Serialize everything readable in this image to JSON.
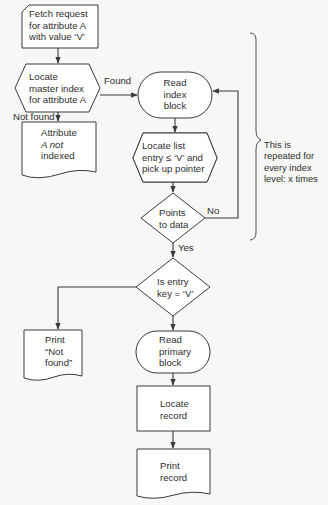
{
  "diagram": {
    "type": "flowchart",
    "nodes": {
      "fetch_request": {
        "shape": "card",
        "lines": [
          "Fetch request",
          "for attribute A",
          "with value ‘V’"
        ]
      },
      "locate_master_index": {
        "shape": "hexagon",
        "lines": [
          "Locate",
          "master index",
          "for attribute A"
        ]
      },
      "attribute_not_indexed": {
        "shape": "document",
        "lines": [
          "Attribute",
          "A not",
          "indexed"
        ]
      },
      "read_index_block": {
        "shape": "terminal",
        "lines": [
          "Read",
          "index",
          "block"
        ]
      },
      "locate_list_entry": {
        "shape": "hexagon",
        "lines": [
          "Locate list",
          "entry ≤ ‘V’ and",
          "pick up pointer"
        ]
      },
      "points_to_data": {
        "shape": "decision",
        "lines": [
          "Points",
          "to data"
        ]
      },
      "is_entry_key": {
        "shape": "decision",
        "lines": [
          "Is entry",
          "key = ‘V’"
        ]
      },
      "print_not_found": {
        "shape": "document",
        "lines": [
          "Print",
          "“Not",
          "found”"
        ]
      },
      "read_primary_block": {
        "shape": "terminal",
        "lines": [
          "Read",
          "primary",
          "block"
        ]
      },
      "locate_record": {
        "shape": "process",
        "lines": [
          "Locate",
          "record"
        ]
      },
      "print_record": {
        "shape": "document",
        "lines": [
          "Print",
          "record"
        ]
      }
    },
    "edge_labels": {
      "found": "Found",
      "not_found": "Not found",
      "no": "No",
      "yes": "Yes"
    },
    "annotation": {
      "lines": [
        "This is",
        "repeated for",
        "every index",
        "level: x times"
      ]
    },
    "colors": {
      "stroke": "#3a3a3a",
      "background": "#f7f7f5",
      "fill": "#ffffff",
      "text": "#2e2e2e"
    }
  }
}
